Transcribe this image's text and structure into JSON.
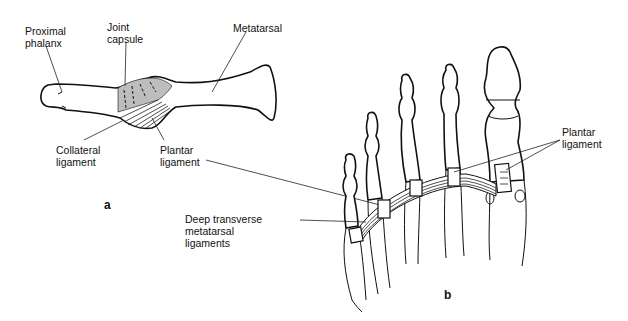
{
  "figure": {
    "panels": [
      {
        "id": "a",
        "label": "a",
        "title": "Metatarsophalangeal joint, side view",
        "labels": {
          "proximal_phalanx": "Proximal\nphalanx",
          "joint_capsule": "Joint\ncapsule",
          "metatarsal": "Metatarsal",
          "collateral_ligament": "Collateral\nligament",
          "plantar_ligament": "Plantar\nligament"
        }
      },
      {
        "id": "b",
        "label": "b",
        "title": "Forefoot, plantar view",
        "labels": {
          "deep_transverse": "Deep transverse\nmetatarsal\nligaments",
          "plantar_ligament": "Plantar\nligament"
        }
      }
    ],
    "colors": {
      "line": "#111111",
      "capsule_fill": "#bdbdbd",
      "background": "#ffffff"
    }
  }
}
